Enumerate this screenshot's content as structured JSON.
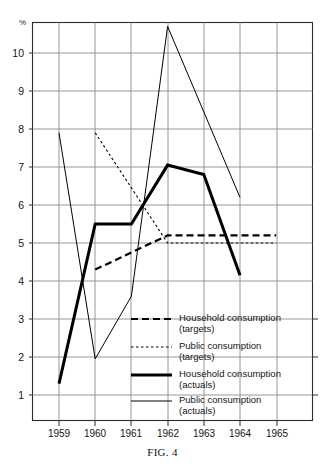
{
  "figure": {
    "caption_prefix": "F",
    "caption_smallcaps": "IG",
    "caption_suffix": ". 4",
    "caption_full": "FIG. 4"
  },
  "axes": {
    "y_unit_label": "%",
    "y_ticks": [
      10,
      9,
      8,
      7,
      6,
      5,
      4,
      3,
      2,
      1
    ],
    "y_tick_labels": [
      "10",
      "9",
      "8",
      "7",
      "6",
      "5",
      "4",
      "3",
      "2",
      "1"
    ],
    "x_ticks": [
      1959,
      1960,
      1961,
      1962,
      1963,
      1964,
      1965
    ],
    "x_tick_labels": [
      "1959",
      "1960",
      "1961",
      "1962",
      "1963",
      "1964",
      "1965"
    ],
    "ylim": [
      0.25,
      11.2
    ],
    "xlim": [
      1958.4,
      1965.95
    ],
    "grid": "horizontal and vertical ruled grid"
  },
  "legend": {
    "position": "inside-lower-right",
    "items": [
      {
        "label_line1": "Household consumption",
        "label_line2": "(targets)",
        "style": "dashed-thick",
        "color": "#000000"
      },
      {
        "label_line1": "Public consumption",
        "label_line2": "(targets)",
        "style": "dotted-thin",
        "color": "#000000"
      },
      {
        "label_line1": "Household consumption",
        "label_line2": "(actuals)",
        "style": "solid-thick",
        "color": "#000000"
      },
      {
        "label_line1": "Public consumption",
        "label_line2": "(actuals)",
        "style": "solid-thin",
        "color": "#000000"
      }
    ]
  },
  "colors": {
    "ink": "#111111",
    "grid": "#8a8a8a",
    "frame": "#2b2b2b",
    "paper": "#ffffff"
  },
  "chart_data": {
    "type": "line",
    "title": "FIG. 4",
    "xlabel": "",
    "ylabel": "%",
    "xlim": [
      1958.4,
      1965.95
    ],
    "ylim": [
      0.25,
      11.2
    ],
    "grid": true,
    "legend_position": "inside-lower-right",
    "x": [
      1959,
      1960,
      1961,
      1962,
      1963,
      1964,
      1965
    ],
    "series": [
      {
        "name": "Household consumption (targets)",
        "style": "dashed",
        "linewidth": 2.2,
        "x": [
          1960,
          1962,
          1965
        ],
        "values": [
          4.3,
          5.2,
          5.2
        ]
      },
      {
        "name": "Public consumption (targets)",
        "style": "dotted",
        "linewidth": 1.1,
        "x": [
          1960,
          1962,
          1965
        ],
        "values": [
          7.9,
          5.0,
          5.0
        ]
      },
      {
        "name": "Household consumption (actuals)",
        "style": "solid",
        "linewidth": 3.0,
        "x": [
          1959,
          1960,
          1961,
          1962,
          1963,
          1964
        ],
        "values": [
          1.3,
          5.5,
          5.5,
          7.05,
          6.8,
          4.15
        ]
      },
      {
        "name": "Public consumption (actuals)",
        "style": "solid",
        "linewidth": 1.0,
        "x": [
          1959,
          1960,
          1961,
          1962,
          1964
        ],
        "values": [
          7.9,
          1.95,
          3.6,
          10.7,
          6.2
        ]
      }
    ]
  }
}
